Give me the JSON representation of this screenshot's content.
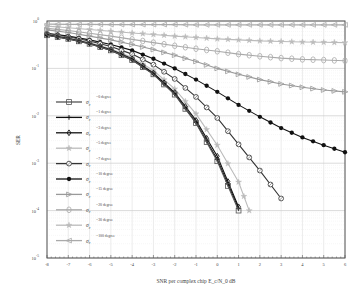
{
  "chart_data": {
    "type": "line",
    "title": "",
    "xlabel": "SNR per complex chip E_c/N_0 dB",
    "ylabel": "SER",
    "xlim": [
      -8,
      6
    ],
    "ylim": [
      1e-05,
      1
    ],
    "yscale": "log",
    "grid": true,
    "legend_position": "inside-left",
    "x_ticks": [
      "-8",
      "-7",
      "-6",
      "-5",
      "-4",
      "-3",
      "-2",
      "-1",
      "0",
      "1",
      "2",
      "3",
      "4",
      "5",
      "6"
    ],
    "y_ticks": [
      "10^0",
      "10^-1",
      "10^-2",
      "10^-3",
      "10^-4",
      "10^-5"
    ],
    "series": [
      {
        "name": "σ_e = 0 degree",
        "marker": "square",
        "color": "#555555",
        "x": [
          -8,
          -7,
          -6,
          -5,
          -4,
          -3,
          -2,
          -1,
          0,
          1
        ],
        "values": [
          0.5,
          0.42,
          0.33,
          0.24,
          0.15,
          0.075,
          0.028,
          0.007,
          0.0011,
          0.0001
        ]
      },
      {
        "name": "σ_e = 1 degree",
        "marker": "plus",
        "color": "#111111",
        "x": [
          -8,
          -7,
          -6,
          -5,
          -4,
          -3,
          -2,
          -1,
          0,
          1
        ],
        "values": [
          0.5,
          0.42,
          0.33,
          0.24,
          0.15,
          0.076,
          0.029,
          0.0072,
          0.0012,
          0.00011
        ]
      },
      {
        "name": "σ_e = 3 degree",
        "marker": "diamond",
        "color": "#111111",
        "x": [
          -8,
          -7,
          -6,
          -5,
          -4,
          -3,
          -2,
          -1,
          0,
          1
        ],
        "values": [
          0.51,
          0.43,
          0.34,
          0.25,
          0.16,
          0.08,
          0.031,
          0.008,
          0.0014,
          0.00012
        ]
      },
      {
        "name": "σ_e = 5 degree",
        "marker": "star",
        "color": "#bbbbbb",
        "x": [
          -8,
          -7,
          -6,
          -5,
          -4,
          -3,
          -2,
          -1,
          0,
          1,
          1.5
        ],
        "values": [
          0.52,
          0.44,
          0.35,
          0.26,
          0.17,
          0.09,
          0.037,
          0.011,
          0.0024,
          0.0004,
          0.0001
        ]
      },
      {
        "name": "σ_e = 7 degree",
        "marker": "circle",
        "color": "#333333",
        "x": [
          -8,
          -7,
          -6,
          -5,
          -4,
          -3,
          -2,
          -1,
          0,
          1,
          2,
          3
        ],
        "values": [
          0.53,
          0.46,
          0.38,
          0.29,
          0.2,
          0.12,
          0.06,
          0.025,
          0.009,
          0.0025,
          0.0007,
          0.00018
        ]
      },
      {
        "name": "σ_e = 10 degree",
        "marker": "filled-circle",
        "color": "#111111",
        "x": [
          -8,
          -7,
          -6,
          -5,
          -4,
          -3,
          -2,
          -1,
          0,
          1,
          2,
          3,
          4,
          5,
          6
        ],
        "values": [
          0.55,
          0.48,
          0.4,
          0.32,
          0.24,
          0.16,
          0.1,
          0.058,
          0.032,
          0.017,
          0.0095,
          0.0055,
          0.0035,
          0.0024,
          0.0017
        ]
      },
      {
        "name": "σ_e = 15 degree",
        "marker": "triangle-right",
        "color": "#999999",
        "x": [
          -8,
          -7,
          -6,
          -5,
          -4,
          -3,
          -2,
          -1,
          0,
          1,
          2,
          3,
          4,
          5,
          6
        ],
        "values": [
          0.65,
          0.57,
          0.48,
          0.4,
          0.32,
          0.25,
          0.19,
          0.14,
          0.1,
          0.075,
          0.058,
          0.047,
          0.04,
          0.035,
          0.032
        ]
      },
      {
        "name": "σ_e = 20 degree",
        "marker": "hexagon",
        "color": "#aaaaaa",
        "x": [
          -8,
          -7,
          -6,
          -5,
          -4,
          -3,
          -2,
          -1,
          0,
          1,
          2,
          3,
          4,
          5,
          6
        ],
        "values": [
          0.7,
          0.63,
          0.55,
          0.48,
          0.41,
          0.35,
          0.3,
          0.26,
          0.23,
          0.2,
          0.18,
          0.165,
          0.155,
          0.15,
          0.145
        ]
      },
      {
        "name": "σ_e = 30 degree",
        "marker": "star",
        "color": "#bbbbbb",
        "x": [
          -8,
          -7,
          -6,
          -5,
          -4,
          -3,
          -2,
          -1,
          0,
          1,
          2,
          3,
          4,
          5,
          6
        ],
        "values": [
          0.78,
          0.72,
          0.66,
          0.61,
          0.56,
          0.52,
          0.48,
          0.45,
          0.42,
          0.4,
          0.38,
          0.37,
          0.36,
          0.355,
          0.35
        ]
      },
      {
        "name": "σ_e = 100 degree",
        "marker": "triangle-left",
        "color": "#aaaaaa",
        "x": [
          -8,
          -7,
          -6,
          -5,
          -4,
          -3,
          -2,
          -1,
          0,
          1,
          2,
          3,
          4,
          5,
          6
        ],
        "values": [
          0.86,
          0.85,
          0.85,
          0.84,
          0.84,
          0.84,
          0.84,
          0.83,
          0.83,
          0.83,
          0.83,
          0.83,
          0.83,
          0.83,
          0.83
        ]
      }
    ]
  }
}
